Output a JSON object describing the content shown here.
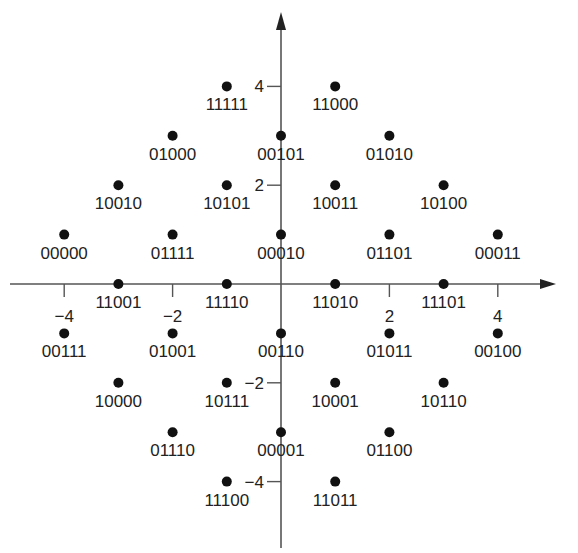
{
  "chart_data": {
    "type": "scatter",
    "title": "",
    "xlabel": "",
    "ylabel": "",
    "xlim": [
      -5,
      5
    ],
    "ylim": [
      -5,
      5
    ],
    "grid": false,
    "x_ticks": [
      -4,
      -2,
      2,
      4
    ],
    "y_ticks": [
      4,
      2,
      -2,
      -4
    ],
    "tick_labels": {
      "x": [
        "−4",
        "−2",
        "2",
        "4"
      ],
      "y": [
        "4",
        "2",
        "−2",
        "−4"
      ]
    },
    "points": [
      {
        "x": -1,
        "y": 4,
        "label": "11111"
      },
      {
        "x": 1,
        "y": 4,
        "label": "11000"
      },
      {
        "x": -2,
        "y": 3,
        "label": "01000"
      },
      {
        "x": 0,
        "y": 3,
        "label": "00101"
      },
      {
        "x": 2,
        "y": 3,
        "label": "01010"
      },
      {
        "x": -3,
        "y": 2,
        "label": "10010"
      },
      {
        "x": -1,
        "y": 2,
        "label": "10101"
      },
      {
        "x": 1,
        "y": 2,
        "label": "10011"
      },
      {
        "x": 3,
        "y": 2,
        "label": "10100"
      },
      {
        "x": -4,
        "y": 1,
        "label": "00000"
      },
      {
        "x": -2,
        "y": 1,
        "label": "01111"
      },
      {
        "x": 0,
        "y": 1,
        "label": "00010"
      },
      {
        "x": 2,
        "y": 1,
        "label": "01101"
      },
      {
        "x": 4,
        "y": 1,
        "label": "00011"
      },
      {
        "x": -3,
        "y": 0,
        "label": "11001"
      },
      {
        "x": -1,
        "y": 0,
        "label": "11110"
      },
      {
        "x": 1,
        "y": 0,
        "label": "11010"
      },
      {
        "x": 3,
        "y": 0,
        "label": "11101"
      },
      {
        "x": -4,
        "y": -1,
        "label": "00111"
      },
      {
        "x": -2,
        "y": -1,
        "label": "01001"
      },
      {
        "x": 0,
        "y": -1,
        "label": "00110"
      },
      {
        "x": 2,
        "y": -1,
        "label": "01011"
      },
      {
        "x": 4,
        "y": -1,
        "label": "00100"
      },
      {
        "x": -3,
        "y": -2,
        "label": "10000"
      },
      {
        "x": -1,
        "y": -2,
        "label": "10111"
      },
      {
        "x": 1,
        "y": -2,
        "label": "10001"
      },
      {
        "x": 3,
        "y": -2,
        "label": "10110"
      },
      {
        "x": -2,
        "y": -3,
        "label": "01110"
      },
      {
        "x": 0,
        "y": -3,
        "label": "00001"
      },
      {
        "x": 2,
        "y": -3,
        "label": "01100"
      },
      {
        "x": -1,
        "y": -4,
        "label": "11100"
      },
      {
        "x": 1,
        "y": -4,
        "label": "11011"
      }
    ]
  },
  "colors": {
    "axis": "#555555",
    "dot": "#111111",
    "text": "#222222"
  }
}
